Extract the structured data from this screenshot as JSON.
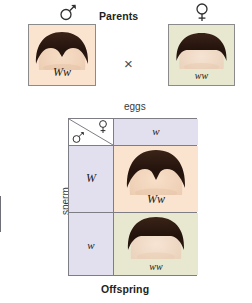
{
  "figure": {
    "title_top": "Parents",
    "title_bottom": "Offspring",
    "cross_symbol": "×"
  },
  "parents": {
    "father": {
      "sex_symbol_name": "mars-male-symbol",
      "genotype": "Ww",
      "phenotype": "widow's peak",
      "background_color": "#fae3cf",
      "has_widows_peak": true
    },
    "mother": {
      "sex_symbol_name": "venus-female-symbol",
      "genotype": "ww",
      "phenotype": "straight hairline",
      "background_color": "#e7e8cf",
      "has_widows_peak": false
    }
  },
  "punnett": {
    "column_axis_label": "eggs",
    "row_axis_label": "sperm",
    "corner": {
      "female_symbol_name": "venus-female-symbol",
      "male_symbol_name": "mars-male-symbol"
    },
    "column_headers": [
      "w"
    ],
    "row_headers": [
      "W",
      "w"
    ],
    "header_background": "#e2e0ef",
    "cells": [
      {
        "genotype": "Ww",
        "row_allele": "W",
        "column_allele": "w",
        "phenotype": "widow's peak",
        "background_color": "#fae3cf",
        "has_widows_peak": true
      },
      {
        "genotype": "ww",
        "row_allele": "w",
        "column_allele": "w",
        "phenotype": "straight hairline",
        "background_color": "#e7e8cf",
        "has_widows_peak": false
      }
    ]
  },
  "colors": {
    "border": "#7d7d85",
    "photo_border": "#8b8b8b",
    "text": "#231f20",
    "hair": "#2b1a13"
  }
}
